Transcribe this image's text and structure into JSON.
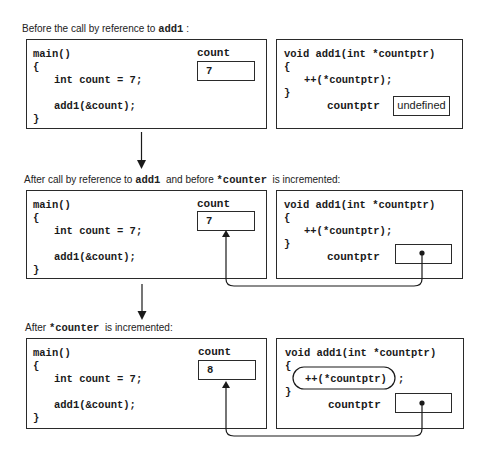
{
  "stages": [
    {
      "caption_parts": [
        "Before the call by reference to ",
        "add1",
        " :"
      ],
      "main_code": [
        "main()",
        "{",
        "int count = 7;",
        "add1(&count);",
        "}"
      ],
      "count_label": "count",
      "count_value": "7",
      "add1_code": [
        "void add1(int *countptr)",
        "{",
        "++(*countptr);",
        "}"
      ],
      "countptr_label": "countptr",
      "countptr_value": "undefined"
    },
    {
      "caption_parts": [
        "After call by reference to ",
        "add1",
        "  and before ",
        "*counter",
        "  is incremented:"
      ],
      "main_code": [
        "main()",
        "{",
        "int count = 7;",
        "add1(&count);",
        "}"
      ],
      "count_label": "count",
      "count_value": "7",
      "add1_code": [
        "void add1(int *countptr)",
        "{",
        "++(*countptr);",
        "}"
      ],
      "countptr_label": "countptr",
      "countptr_value": "pointer-dot"
    },
    {
      "caption_parts": [
        "After ",
        "*counter",
        "  is incremented:"
      ],
      "main_code": [
        "main()",
        "{",
        "int count = 7;",
        "add1(&count);",
        "}"
      ],
      "count_label": "count",
      "count_value": "8",
      "add1_code": [
        "void add1(int *countptr)",
        "{",
        "++(*countptr)",
        ";",
        "}"
      ],
      "countptr_label": "countptr",
      "countptr_value": "pointer-dot"
    }
  ],
  "colors": {
    "line": "#2a2a2a",
    "background": "#ffffff"
  }
}
